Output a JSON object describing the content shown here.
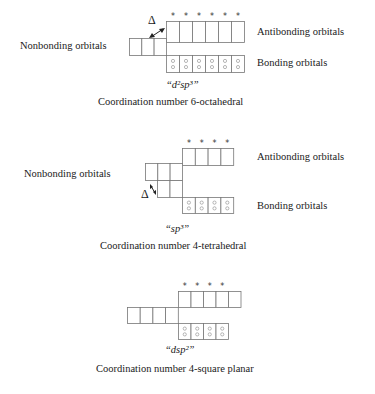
{
  "diagrams": [
    {
      "id": "octahedral",
      "nonbonding_label": "Nonbonding orbitals",
      "antibonding_label": "Antibonding orbitals",
      "bonding_label": "Bonding orbitals",
      "delta_symbol": "Δ",
      "hybridization": "“d²sp³”",
      "caption": "Coordination number 6-octahedral",
      "antibonding_count": 6,
      "antibonding_starred": 6,
      "nonbonding_count": 3,
      "bonding_count": 6
    },
    {
      "id": "tetrahedral",
      "nonbonding_label": "Nonbonding orbitals",
      "antibonding_label": "Antibonding orbitals",
      "bonding_label": "Bonding orbitals",
      "delta_symbol": "Δ",
      "hybridization": "“sp³”",
      "caption": "Coordination number 4-tetrahedral",
      "antibonding_count": 4,
      "antibonding_starred": 4,
      "nonbonding_count": 5,
      "bonding_count": 4
    },
    {
      "id": "square-planar",
      "hybridization": "“dsp²”",
      "caption": "Coordination number 4-square planar",
      "antibonding_count": 5,
      "antibonding_starred": 4,
      "nonbonding_count": 4,
      "bonding_count": 4
    }
  ],
  "star_symbol": "*"
}
